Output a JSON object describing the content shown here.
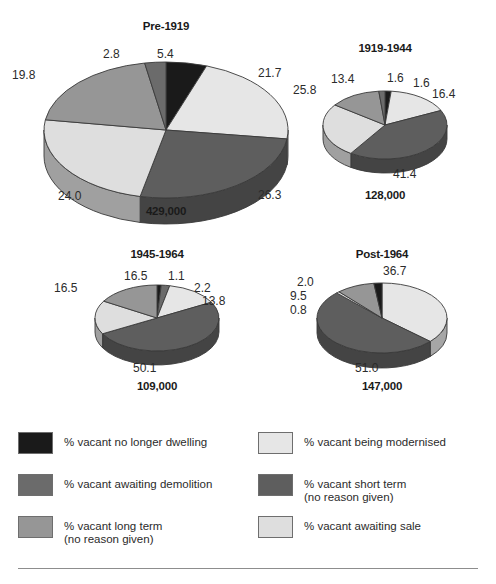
{
  "colors": {
    "no_longer_dwelling": "#1a1a1a",
    "awaiting_demolition": "#6b6b6b",
    "long_term": "#969696",
    "being_modernised": "#e6e6e6",
    "short_term": "#5e5e5e",
    "awaiting_sale": "#dedede",
    "side_dark": "#4f4f4f",
    "outline": "#3a3a3a",
    "divider": "#8d8d8d",
    "label_text": "#2b2b2b"
  },
  "legend": {
    "left": [
      {
        "key": "no_longer_dwelling",
        "label": "% vacant no longer dwelling",
        "color": "#1a1a1a"
      },
      {
        "key": "awaiting_demolition",
        "label": "% vacant awaiting demolition",
        "color": "#6b6b6b"
      },
      {
        "key": "long_term",
        "label": "% vacant long term\n(no reason given)",
        "color": "#969696"
      }
    ],
    "right": [
      {
        "key": "being_modernised",
        "label": "% vacant being modernised",
        "color": "#e6e6e6"
      },
      {
        "key": "short_term",
        "label": "% vacant short term\n(no reason given)",
        "color": "#5e5e5e"
      },
      {
        "key": "awaiting_sale",
        "label": "% vacant awaiting sale",
        "color": "#dedede"
      }
    ]
  },
  "chart_data": [
    {
      "type": "pie",
      "title": "Pre-1919",
      "total_label": "429,000",
      "categories": [
        "% vacant no longer dwelling",
        "% vacant being modernised",
        "% vacant short term (no reason given)",
        "% vacant awaiting sale",
        "% vacant long term (no reason given)",
        "% vacant awaiting demolition"
      ],
      "values": [
        5.4,
        21.7,
        26.3,
        24.0,
        19.8,
        2.8
      ],
      "value_labels": [
        "5.4",
        "21.7",
        "26.3",
        "24.0",
        "19.8",
        "2.8"
      ],
      "slice_colors": [
        "#1a1a1a",
        "#e6e6e6",
        "#5e5e5e",
        "#dedede",
        "#969696",
        "#6b6b6b"
      ],
      "ylabel": "",
      "xlabel": ""
    },
    {
      "type": "pie",
      "title": "1919-1944",
      "total_label": "128,000",
      "categories": [
        "% vacant no longer dwelling",
        "% vacant being modernised",
        "% vacant short term (no reason given)",
        "% vacant awaiting sale",
        "% vacant long term (no reason given)",
        "% vacant awaiting demolition"
      ],
      "values": [
        1.6,
        16.4,
        41.4,
        25.8,
        13.4,
        1.6
      ],
      "value_labels": [
        "1.6",
        "16.4",
        "41.4",
        "25.8",
        "13.4",
        "1.6"
      ],
      "slice_colors": [
        "#1a1a1a",
        "#e6e6e6",
        "#5e5e5e",
        "#dedede",
        "#969696",
        "#6b6b6b"
      ],
      "ylabel": "",
      "xlabel": ""
    },
    {
      "type": "pie",
      "title": "1945-1964",
      "total_label": "109,000",
      "categories": [
        "% vacant no longer dwelling",
        "% vacant awaiting demolition",
        "% vacant being modernised",
        "% vacant short term (no reason given)",
        "% vacant awaiting sale",
        "% vacant long term (no reason given)"
      ],
      "values": [
        1.1,
        2.2,
        13.8,
        50.1,
        16.5,
        16.5
      ],
      "value_labels": [
        "1.1",
        "2.2",
        "13.8",
        "50.1",
        "16.5",
        "16.5"
      ],
      "slice_colors": [
        "#1a1a1a",
        "#6b6b6b",
        "#e6e6e6",
        "#5e5e5e",
        "#dedede",
        "#969696"
      ],
      "ylabel": "",
      "xlabel": ""
    },
    {
      "type": "pie",
      "title": "Post-1964",
      "total_label": "147,000",
      "categories": [
        "% vacant being modernised",
        "% vacant short term (no reason given)",
        "% vacant awaiting sale",
        "% vacant long term (no reason given)",
        "% vacant no longer dwelling"
      ],
      "values": [
        36.7,
        51.0,
        0.8,
        9.5,
        2.0
      ],
      "value_labels": [
        "36.7",
        "51.0",
        "0.8",
        "9.5",
        "2.0"
      ],
      "slice_colors": [
        "#e6e6e6",
        "#5e5e5e",
        "#dedede",
        "#969696",
        "#1a1a1a"
      ],
      "ylabel": "",
      "xlabel": ""
    }
  ],
  "layout": {
    "pies": [
      {
        "title_pos": {
          "left": 101,
          "top": 20,
          "width": 130
        },
        "total_pos": {
          "left": 101,
          "top": 205,
          "width": 130
        },
        "cx": 166,
        "cy": 130,
        "rx": 122,
        "ry": 68,
        "depth": 26,
        "start_angle": -90,
        "labels": [
          {
            "text_idx": 0,
            "left": 157,
            "top": 47
          },
          {
            "text_idx": 1,
            "left": 258,
            "top": 66
          },
          {
            "text_idx": 2,
            "left": 258,
            "top": 188
          },
          {
            "text_idx": 3,
            "left": 58,
            "top": 189
          },
          {
            "text_idx": 4,
            "left": 12,
            "top": 68
          },
          {
            "text_idx": 5,
            "left": 103,
            "top": 47
          }
        ]
      },
      {
        "title_pos": {
          "left": 330,
          "top": 42,
          "width": 110
        },
        "total_pos": {
          "left": 330,
          "top": 189,
          "width": 110
        },
        "cx": 385,
        "cy": 125,
        "rx": 62,
        "ry": 34,
        "depth": 14,
        "start_angle": -90,
        "labels": [
          {
            "text_idx": 0,
            "left": 387,
            "top": 71
          },
          {
            "text_idx": 1,
            "left": 432,
            "top": 87
          },
          {
            "text_idx": 2,
            "left": 393,
            "top": 167
          },
          {
            "text_idx": 3,
            "left": 293,
            "top": 83
          },
          {
            "text_idx": 4,
            "left": 331,
            "top": 72
          },
          {
            "text_idx": 5,
            "left": 413,
            "top": 76
          }
        ]
      },
      {
        "title_pos": {
          "left": 99,
          "top": 248,
          "width": 116
        },
        "total_pos": {
          "left": 99,
          "top": 380,
          "width": 116
        },
        "cx": 157,
        "cy": 318,
        "rx": 62,
        "ry": 33,
        "depth": 14,
        "start_angle": -90,
        "labels": [
          {
            "text_idx": 0,
            "left": 168,
            "top": 269
          },
          {
            "text_idx": 1,
            "left": 194,
            "top": 281
          },
          {
            "text_idx": 2,
            "left": 202,
            "top": 294
          },
          {
            "text_idx": 3,
            "left": 133,
            "top": 361
          },
          {
            "text_idx": 4,
            "left": 124,
            "top": 269
          },
          {
            "text_idx": 5,
            "left": 54,
            "top": 281
          }
        ]
      },
      {
        "title_pos": {
          "left": 329,
          "top": 248,
          "width": 106
        },
        "total_pos": {
          "left": 329,
          "top": 380,
          "width": 106
        },
        "cx": 382,
        "cy": 318,
        "rx": 65,
        "ry": 35,
        "depth": 15,
        "start_angle": -90,
        "labels": [
          {
            "text_idx": 0,
            "left": 383,
            "top": 264
          },
          {
            "text_idx": 1,
            "left": 355,
            "top": 361
          },
          {
            "text_idx": 2,
            "left": 290,
            "top": 303
          },
          {
            "text_idx": 3,
            "left": 290,
            "top": 289
          },
          {
            "text_idx": 4,
            "left": 297,
            "top": 275
          }
        ]
      }
    ]
  }
}
